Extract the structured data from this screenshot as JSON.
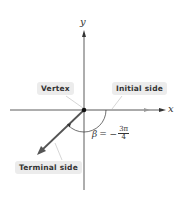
{
  "diagram": {
    "axes": {
      "x_label": "x",
      "y_label": "y"
    },
    "labels": {
      "vertex": "Vertex",
      "initial_side": "Initial side",
      "terminal_side": "Terminal side"
    },
    "angle": {
      "symbol": "β",
      "equals": "= −",
      "numerator": "3π",
      "denominator": "4"
    },
    "colors": {
      "axis": "#333333",
      "terminal": "#555555",
      "label_bg": "#ececec"
    }
  }
}
